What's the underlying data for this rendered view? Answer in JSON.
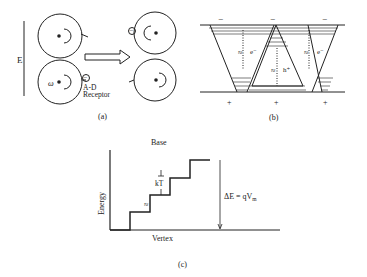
{
  "panel_a": {
    "label": "(a)",
    "field_label": "E",
    "omega_label": "ω",
    "receptor_label_1": "A-D",
    "receptor_label_2": "Receptor",
    "charge_symbol": "−"
  },
  "panel_b": {
    "label": "(b)",
    "top_charges": [
      "−",
      "−",
      "−"
    ],
    "bottom_charges": [
      "+",
      "+",
      "+"
    ],
    "carrier_labels": [
      "e⁻",
      "h⁺",
      "e⁻"
    ],
    "approx_symbol": "≈"
  },
  "panel_c": {
    "label": "(c)",
    "top_label": "Base",
    "bottom_label": "Vertex",
    "y_axis_label": "Energy",
    "step_label": "kT",
    "delta_label": "ΔE = qV",
    "delta_sub": "m",
    "approx_symbol": "≈"
  },
  "colors": {
    "ink": "#222222",
    "background": "#ffffff"
  }
}
